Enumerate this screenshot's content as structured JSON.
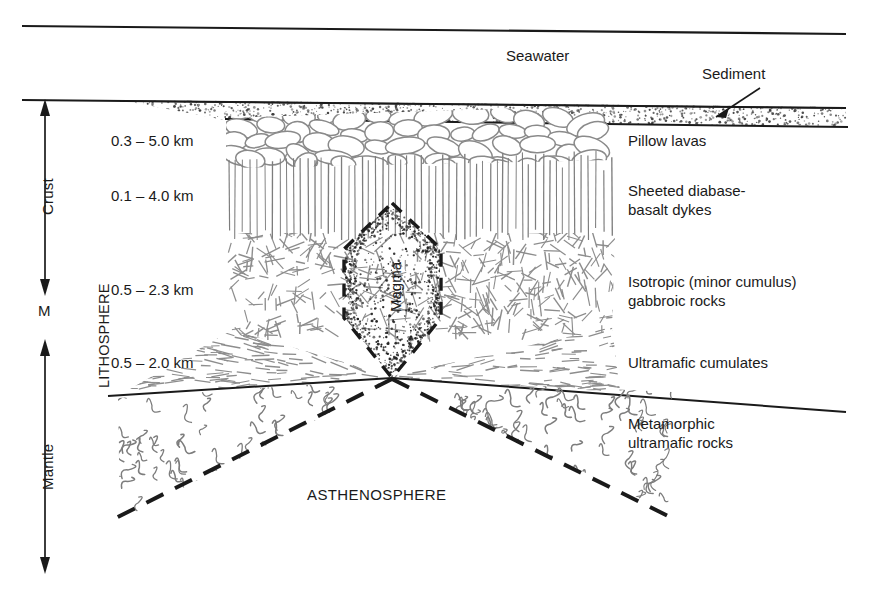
{
  "figure": {
    "type": "geological-cross-section",
    "background_color": "#ffffff",
    "line_color": "#1a1a1a",
    "texture_color": "#8a8a8a"
  },
  "water": {
    "label": "Seawater"
  },
  "sediment": {
    "label": "Sediment"
  },
  "left_axis": {
    "crust_label": "Crust",
    "moho_label": "M",
    "mantle_label": "Mantle",
    "lithosphere_label": "LITHOSPHERE"
  },
  "asthenosphere": {
    "label": "ASTHENOSPHERE"
  },
  "magma": {
    "label": "Magma"
  },
  "layers": [
    {
      "id": "pillow-lavas",
      "thickness": "0.3 – 5.0 km",
      "name": "Pillow lavas"
    },
    {
      "id": "sheeted-dykes",
      "thickness": "0.1 – 4.0 km",
      "name": "Sheeted diabase-\nbasalt dykes"
    },
    {
      "id": "isotropic-gabbro",
      "thickness": "0.5 – 2.3 km",
      "name": "Isotropic (minor cumulus)\ngabbroic rocks"
    },
    {
      "id": "ultramafic-cumulates",
      "thickness": "0.5 – 2.0 km",
      "name": "Ultramafic cumulates"
    },
    {
      "id": "metamorphic-ultramafic",
      "thickness": "",
      "name": "Metamorphic\nultramafic rocks"
    }
  ],
  "chart_data": {
    "type": "diagram",
    "categories": [
      "Pillow lavas",
      "Sheeted diabase-basalt dykes",
      "Isotropic (minor cumulus) gabbroic rocks",
      "Ultramafic cumulates",
      "Metamorphic ultramafic rocks"
    ],
    "thickness_ranges_km": [
      [
        0.3,
        5.0
      ],
      [
        0.1,
        4.0
      ],
      [
        0.5,
        2.3
      ],
      [
        0.5,
        2.0
      ],
      [
        null,
        null
      ]
    ],
    "annotations": [
      "Seawater",
      "Sediment",
      "Magma",
      "LITHOSPHERE",
      "ASTHENOSPHERE",
      "Crust",
      "M",
      "Mantle"
    ]
  }
}
